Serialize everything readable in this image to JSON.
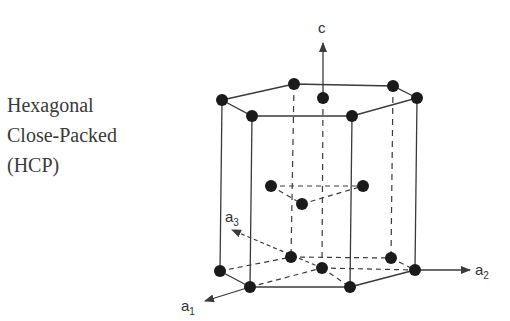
{
  "title": {
    "lines": [
      "Hexagonal",
      "Close-Packed",
      "(HCP)"
    ]
  },
  "axes": {
    "c": {
      "label": "c"
    },
    "a1": {
      "label": "a",
      "subscript": "1"
    },
    "a2": {
      "label": "a",
      "subscript": "2"
    },
    "a3": {
      "label": "a",
      "subscript": "3"
    }
  },
  "colors": {
    "line": "#3a3a3a",
    "atom": "#1a1a1a",
    "text": "#3a3a3a"
  }
}
